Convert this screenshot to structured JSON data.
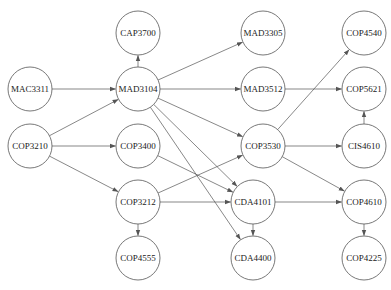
{
  "diagram": {
    "type": "directed-graph",
    "title": "",
    "node_radius": 22,
    "colors": {
      "node_fill": "#ffffff",
      "stroke": "#555555",
      "text": "#222222"
    },
    "nodes": [
      {
        "id": "CAP3700",
        "label": "CAP3700",
        "x": 138,
        "y": 33
      },
      {
        "id": "MAD3305",
        "label": "MAD3305",
        "x": 263,
        "y": 33
      },
      {
        "id": "COP4540",
        "label": "COP4540",
        "x": 364,
        "y": 33
      },
      {
        "id": "MAC3311",
        "label": "MAC3311",
        "x": 30,
        "y": 89
      },
      {
        "id": "MAD3104",
        "label": "MAD3104",
        "x": 138,
        "y": 89
      },
      {
        "id": "MAD3512",
        "label": "MAD3512",
        "x": 263,
        "y": 89
      },
      {
        "id": "COP5621",
        "label": "COP5621",
        "x": 364,
        "y": 89
      },
      {
        "id": "COP3210",
        "label": "COP3210",
        "x": 30,
        "y": 146
      },
      {
        "id": "COP3400",
        "label": "COP3400",
        "x": 138,
        "y": 146
      },
      {
        "id": "COP3530",
        "label": "COP3530",
        "x": 263,
        "y": 146
      },
      {
        "id": "CIS4610",
        "label": "CIS4610",
        "x": 364,
        "y": 146
      },
      {
        "id": "COP3212",
        "label": "COP3212",
        "x": 138,
        "y": 202
      },
      {
        "id": "CDA4101",
        "label": "CDA4101",
        "x": 253,
        "y": 202
      },
      {
        "id": "COP4610",
        "label": "COP4610",
        "x": 364,
        "y": 202
      },
      {
        "id": "COP4555",
        "label": "COP4555",
        "x": 138,
        "y": 258
      },
      {
        "id": "CDA4400",
        "label": "CDA4400",
        "x": 253,
        "y": 258
      },
      {
        "id": "COP4225",
        "label": "COP4225",
        "x": 364,
        "y": 258
      }
    ],
    "edges": [
      {
        "from": "MAC3311",
        "to": "MAD3104"
      },
      {
        "from": "COP3210",
        "to": "MAD3104"
      },
      {
        "from": "COP3210",
        "to": "COP3400"
      },
      {
        "from": "COP3210",
        "to": "COP3212"
      },
      {
        "from": "MAD3104",
        "to": "CAP3700"
      },
      {
        "from": "MAD3104",
        "to": "MAD3305"
      },
      {
        "from": "MAD3104",
        "to": "MAD3512"
      },
      {
        "from": "MAD3104",
        "to": "COP3530"
      },
      {
        "from": "MAD3104",
        "to": "CDA4101"
      },
      {
        "from": "MAD3104",
        "to": "CDA4400"
      },
      {
        "from": "COP3400",
        "to": "CDA4101"
      },
      {
        "from": "COP3212",
        "to": "COP3530"
      },
      {
        "from": "COP3212",
        "to": "CDA4101"
      },
      {
        "from": "COP3212",
        "to": "COP4555"
      },
      {
        "from": "COP3530",
        "to": "COP4540"
      },
      {
        "from": "COP3530",
        "to": "CIS4610"
      },
      {
        "from": "COP3530",
        "to": "COP4610"
      },
      {
        "from": "MAD3512",
        "to": "COP5621"
      },
      {
        "from": "CIS4610",
        "to": "COP5621"
      },
      {
        "from": "CDA4101",
        "to": "CDA4400"
      },
      {
        "from": "CDA4101",
        "to": "COP4610"
      },
      {
        "from": "COP4610",
        "to": "COP4225"
      }
    ]
  }
}
